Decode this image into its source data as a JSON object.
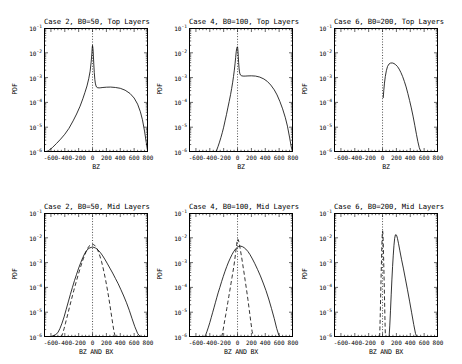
{
  "figure": {
    "background": "#ffffff",
    "ink": "#000000",
    "rows": 2,
    "cols": 3
  },
  "axis": {
    "ylabel": "PDF",
    "ytick_labels": [
      "10-1",
      "10-2",
      "10-3",
      "10-4",
      "10-5",
      "10-6"
    ],
    "ytick_mantissa": "10",
    "ytick_exponents": [
      "-1",
      "-2",
      "-3",
      "-4",
      "-5",
      "-6"
    ],
    "xtick_labels": [
      "-600",
      "-400",
      "-200",
      "0",
      "200",
      "400",
      "600",
      "800"
    ],
    "xlabel_top": "BZ",
    "xlabel_mid": "BZ AND BX"
  },
  "chart_data": {
    "type": "line",
    "ylabel": "PDF",
    "ylim": [
      1e-06,
      0.1
    ],
    "yscale": "log",
    "xlim": [
      -700,
      800
    ],
    "xticks": [
      -600,
      -400,
      -200,
      0,
      200,
      400,
      600,
      800
    ],
    "grid": false,
    "legend": "none",
    "annotations": [
      "dotted vertical reference line at x = 0"
    ],
    "panels": [
      {
        "id": "case2-top",
        "title": "Case 2, B0=50, Top Layers",
        "row": 0,
        "col": 0,
        "xlabel": "BZ",
        "series": [
          {
            "name": "BZ",
            "style": "solid",
            "x": [
              -700,
              -640,
              -580,
              -520,
              -460,
              -400,
              -340,
              -280,
              -230,
              -180,
              -140,
              -110,
              -80,
              -55,
              -35,
              -20,
              -10,
              -4,
              0,
              6,
              12,
              18,
              25,
              33,
              40,
              50,
              60,
              75,
              95,
              120,
              150,
              200,
              260,
              330,
              400,
              470,
              540,
              600,
              650,
              690,
              720,
              750,
              775,
              790,
              800
            ],
            "y": [
              9e-07,
              1.1e-06,
              1.5e-06,
              2.2e-06,
              3.3e-06,
              5.2e-06,
              9e-06,
              1.8e-05,
              3.4e-05,
              7e-05,
              0.00014,
              0.00025,
              0.00046,
              0.0009,
              0.0018,
              0.0042,
              0.009,
              0.017,
              0.02,
              0.015,
              0.008,
              0.0036,
              0.0016,
              0.00085,
              0.0006,
              0.00046,
              0.00041,
              0.00039,
              0.000385,
              0.00039,
              0.0004,
              0.00041,
              0.000415,
              0.0004,
              0.00037,
              0.00031,
              0.00023,
              0.00015,
              8.5e-05,
              4.2e-05,
              2e-05,
              7e-06,
              2.4e-06,
              1.3e-06,
              9e-07
            ]
          }
        ]
      },
      {
        "id": "case4-top",
        "title": "Case 4, B0=100, Top Layers",
        "row": 0,
        "col": 1,
        "xlabel": "BZ",
        "series": [
          {
            "name": "BZ",
            "style": "solid",
            "x": [
              -320,
              -300,
              -280,
              -260,
              -240,
              -220,
              -200,
              -180,
              -160,
              -140,
              -120,
              -100,
              -85,
              -70,
              -58,
              -46,
              -36,
              -27,
              -19,
              -12,
              -6,
              -2,
              2,
              6,
              11,
              16,
              22,
              28,
              35,
              45,
              60,
              80,
              110,
              150,
              200,
              260,
              320,
              380,
              430,
              480,
              530,
              570,
              610,
              650,
              690,
              720,
              750,
              775,
              790,
              800
            ],
            "y": [
              9e-07,
              1.2e-06,
              1.7e-06,
              2.5e-06,
              3.8e-06,
              6e-06,
              1e-05,
              1.8e-05,
              3.2e-05,
              6e-05,
              0.00011,
              0.00021,
              0.00036,
              0.00065,
              0.0011,
              0.002,
              0.0036,
              0.0065,
              0.011,
              0.015,
              0.017,
              0.0175,
              0.016,
              0.012,
              0.007,
              0.004,
              0.0024,
              0.0017,
              0.0014,
              0.00125,
              0.00118,
              0.00115,
              0.00115,
              0.00117,
              0.00118,
              0.00115,
              0.00105,
              0.00088,
              0.0007,
              0.0005,
              0.00032,
              0.0002,
              0.00011,
              5.5e-05,
              2.4e-05,
              1.1e-05,
              4e-06,
              1.6e-06,
              1.1e-06,
              9e-07
            ]
          }
        ]
      },
      {
        "id": "case6-top",
        "title": "Case 6, B0=200, Top Layers",
        "row": 0,
        "col": 2,
        "xlabel": "BZ",
        "series": [
          {
            "name": "BZ",
            "style": "solid",
            "x": [
              10,
              18,
              28,
              40,
              55,
              72,
              92,
              115,
              140,
              165,
              190,
              215,
              240,
              265,
              290,
              315,
              340,
              365,
              390,
              415,
              440,
              465,
              490,
              510,
              530,
              548,
              562,
              572,
              580
            ],
            "y": [
              0.00015,
              0.0003,
              0.0006,
              0.0011,
              0.0019,
              0.0028,
              0.0035,
              0.00385,
              0.0039,
              0.0037,
              0.0033,
              0.0028,
              0.0022,
              0.0016,
              0.0011,
              0.0007,
              0.00042,
              0.00023,
              0.00012,
              6e-05,
              2.8e-05,
              1.2e-05,
              5e-06,
              2.6e-06,
              1.5e-06,
              1.1e-06,
              9.5e-07,
              9e-07,
              9e-07
            ]
          }
        ]
      },
      {
        "id": "case2-mid",
        "title": "Case 2, B0=50, Mid Layers",
        "row": 1,
        "col": 0,
        "xlabel": "BZ AND BX",
        "series": [
          {
            "name": "BZ",
            "style": "solid",
            "x": [
              -700,
              -660,
              -620,
              -580,
              -540,
              -500,
              -470,
              -440,
              -410,
              -380,
              -350,
              -320,
              -290,
              -260,
              -230,
              -200,
              -170,
              -140,
              -110,
              -80,
              -50,
              -20,
              0,
              20,
              40,
              60,
              80,
              110,
              140,
              175,
              210,
              250,
              290,
              330,
              370,
              410,
              450,
              490,
              530,
              570,
              610,
              650,
              680,
              710,
              740,
              770,
              800
            ],
            "y": [
              9.5e-07,
              1e-06,
              1e-06,
              1.1e-06,
              1.2e-06,
              1.5e-06,
              2.2e-06,
              3.6e-06,
              6.5e-06,
              1.3e-05,
              2.6e-05,
              5.2e-05,
              0.0001,
              0.00019,
              0.00034,
              0.0006,
              0.001,
              0.0016,
              0.0024,
              0.0032,
              0.0038,
              0.0041,
              0.0042,
              0.0041,
              0.0039,
              0.0036,
              0.0032,
              0.0026,
              0.002,
              0.0014,
              0.00095,
              0.0006,
              0.00038,
              0.00023,
              0.00014,
              8e-05,
              4.5e-05,
              2.4e-05,
              1.2e-05,
              5.5e-06,
              2.6e-06,
              1.4e-06,
              1.1e-06,
              1e-06,
              9.5e-07,
              9.5e-07,
              9.5e-07
            ]
          },
          {
            "name": "BX",
            "style": "dashed",
            "x": [
              -450,
              -430,
              -410,
              -390,
              -370,
              -350,
              -330,
              -310,
              -290,
              -270,
              -250,
              -230,
              -210,
              -190,
              -170,
              -150,
              -130,
              -110,
              -90,
              -70,
              -50,
              -30,
              -10,
              10,
              30,
              50,
              70,
              90,
              110,
              130,
              150,
              170,
              190,
              210,
              230,
              250,
              270,
              290,
              310,
              330,
              350
            ],
            "y": [
              9.5e-07,
              1.4e-06,
              2.2e-06,
              3.6e-06,
              6e-06,
              1e-05,
              1.7e-05,
              2.8e-05,
              4.6e-05,
              7.5e-05,
              0.00012,
              0.00019,
              0.0003,
              0.00046,
              0.0007,
              0.00105,
              0.0015,
              0.0021,
              0.0029,
              0.0038,
              0.0046,
              0.0052,
              0.0055,
              0.0054,
              0.005,
              0.0043,
              0.0034,
              0.0025,
              0.0017,
              0.0011,
              0.00065,
              0.00036,
              0.00019,
              9.5e-05,
              4.5e-05,
              2e-05,
              8.5e-06,
              3.6e-06,
              1.6e-06,
              1e-06,
              9.5e-07
            ]
          }
        ]
      },
      {
        "id": "case4-mid",
        "title": "Case 4, B0=100, Mid Layers",
        "row": 1,
        "col": 1,
        "xlabel": "BZ AND BX",
        "series": [
          {
            "name": "BZ",
            "style": "solid",
            "x": [
              -480,
              -460,
              -440,
              -420,
              -400,
              -380,
              -360,
              -340,
              -320,
              -300,
              -280,
              -255,
              -230,
              -205,
              -180,
              -155,
              -130,
              -105,
              -80,
              -55,
              -30,
              -5,
              20,
              45,
              70,
              95,
              120,
              150,
              180,
              215,
              250,
              290,
              330,
              370,
              410,
              450,
              490,
              530,
              565,
              595,
              620,
              645,
              665,
              680
            ],
            "y": [
              9.5e-07,
              1.2e-06,
              1.7e-06,
              2.5e-06,
              3.8e-06,
              6e-06,
              9.5e-06,
              1.5e-05,
              2.4e-05,
              3.8e-05,
              6e-05,
              0.0001,
              0.00017,
              0.00028,
              0.00045,
              0.0007,
              0.00105,
              0.0015,
              0.0021,
              0.0028,
              0.0035,
              0.0041,
              0.0045,
              0.0046,
              0.0044,
              0.004,
              0.0035,
              0.0028,
              0.0021,
              0.0014,
              0.0009,
              0.00052,
              0.00029,
              0.00015,
              7.5e-05,
              3.4e-05,
              1.4e-05,
              5.5e-06,
              2.2e-06,
              1.2e-06,
              1e-06,
              9.5e-07,
              9.5e-07,
              9.5e-07
            ]
          },
          {
            "name": "BX",
            "style": "dashed",
            "x": [
              -230,
              -215,
              -200,
              -185,
              -170,
              -155,
              -140,
              -125,
              -110,
              -95,
              -80,
              -65,
              -52,
              -40,
              -30,
              -20,
              -12,
              -5,
              2,
              10,
              20,
              32,
              45,
              60,
              75,
              92,
              110,
              130,
              150,
              170,
              190,
              210,
              230
            ],
            "y": [
              9.5e-07,
              1.5e-06,
              2.6e-06,
              4.6e-06,
              8e-06,
              1.4e-05,
              2.5e-05,
              4.4e-05,
              7.8e-05,
              0.00014,
              0.00025,
              0.00044,
              0.00075,
              0.0013,
              0.0022,
              0.0036,
              0.0055,
              0.0078,
              0.009,
              0.0086,
              0.0068,
              0.0046,
              0.0028,
              0.0016,
              0.00085,
              0.00042,
              0.00019,
              8e-05,
              3.2e-05,
              1.2e-05,
              4.4e-06,
              1.7e-06,
              9.5e-07
            ]
          }
        ]
      },
      {
        "id": "case6-mid",
        "title": "Case 6, B0=200, Mid Layers",
        "row": 1,
        "col": 2,
        "xlabel": "BZ AND BX",
        "series": [
          {
            "name": "BZ",
            "style": "solid",
            "x": [
              95,
              105,
              115,
              125,
              135,
              145,
              155,
              165,
              175,
              185,
              195,
              205,
              215,
              230,
              250,
              275,
              300,
              330,
              360,
              390,
              420,
              450,
              475,
              495,
              510,
              520
            ],
            "y": [
              9.5e-07,
              3e-06,
              1.2e-05,
              5e-05,
              0.0002,
              0.0007,
              0.002,
              0.005,
              0.0095,
              0.013,
              0.0135,
              0.012,
              0.0095,
              0.006,
              0.003,
              0.0013,
              0.0006,
              0.00022,
              8e-05,
              2.8e-05,
              9.5e-06,
              3.2e-06,
              1.4e-06,
              1e-06,
              9.5e-07,
              9.5e-07
            ]
          },
          {
            "name": "BX",
            "style": "dashed",
            "x": [
              -42,
              -38,
              -34,
              -30,
              -26,
              -22,
              -18,
              -14,
              -10,
              -6,
              -2,
              2,
              6,
              10,
              14,
              18,
              22,
              26,
              30,
              34,
              38,
              42
            ],
            "y": [
              9.5e-07,
              2.2e-06,
              6e-06,
              1.8e-05,
              5.5e-05,
              0.00018,
              0.00055,
              0.0016,
              0.0045,
              0.01,
              0.0175,
              0.019,
              0.014,
              0.0065,
              0.0024,
              0.0008,
              0.00026,
              8e-05,
              2.4e-05,
              7e-06,
              2.2e-06,
              9.5e-07
            ]
          }
        ]
      }
    ]
  }
}
